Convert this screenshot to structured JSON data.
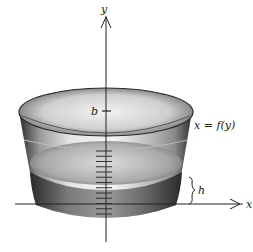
{
  "diagram": {
    "axes": {
      "y_label": "y",
      "x_label": "x"
    },
    "labels": {
      "b": "b",
      "curve": "x = f(y)",
      "height": "h"
    },
    "scale_tick_count": 13,
    "colors": {
      "ink": "#222222",
      "glass_dark": "#3a3a3a",
      "glass_light": "#e8e8e8",
      "water": "#6f6f6f"
    }
  }
}
